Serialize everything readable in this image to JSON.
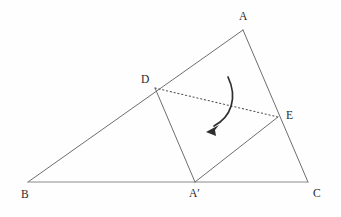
{
  "figure": {
    "type": "geometry-diagram",
    "canvas": {
      "width": 341,
      "height": 217
    },
    "background_color": "#fefefe",
    "line_color": "#6e6e6e",
    "base_line_color": "#8a8a8a",
    "crease_color": "#555555",
    "arrow_color": "#2e2e2e",
    "label_color": "#2a2a2a"
  },
  "points": [
    {
      "id": "A",
      "label": "A",
      "x": 243,
      "y": 30,
      "label_x": 239,
      "label_y": 11
    },
    {
      "id": "B",
      "label": "B",
      "x": 28,
      "y": 182,
      "label_x": 21,
      "label_y": 189
    },
    {
      "id": "C",
      "label": "C",
      "x": 308,
      "y": 182,
      "label_x": 313,
      "label_y": 188
    },
    {
      "id": "D",
      "label": "D",
      "x": 155,
      "y": 88,
      "label_x": 141,
      "label_y": 74
    },
    {
      "id": "E",
      "label": "E",
      "x": 278,
      "y": 117,
      "label_x": 286,
      "label_y": 110
    },
    {
      "id": "Ap",
      "label": "A′",
      "x": 195,
      "y": 182,
      "label_x": 189,
      "label_y": 188
    }
  ],
  "segments": [
    {
      "name": "side-b-to-a",
      "from": "B",
      "to": "A",
      "style": "solid"
    },
    {
      "name": "side-a-to-c",
      "from": "A",
      "to": "C",
      "style": "solid"
    },
    {
      "name": "side-b-to-c",
      "from": "B",
      "to": "C",
      "style": "base"
    },
    {
      "name": "fold-d-to-aprime",
      "from": "D",
      "to": "Ap",
      "style": "solid"
    },
    {
      "name": "fold-aprime-to-e",
      "from": "Ap",
      "to": "E",
      "style": "solid"
    },
    {
      "name": "crease-d-to-e",
      "from": "D",
      "to": "E",
      "style": "dotted"
    }
  ],
  "rotation_arrow": {
    "name": "fold-rotation-arrow",
    "start_x": 228,
    "start_y": 77,
    "control1_x": 238,
    "control1_y": 98,
    "control2_x": 230,
    "control2_y": 118,
    "end_x": 213,
    "end_y": 127,
    "head_x": 208,
    "head_y": 131,
    "head_angle_deg": 218,
    "direction": "clockwise-downward"
  }
}
